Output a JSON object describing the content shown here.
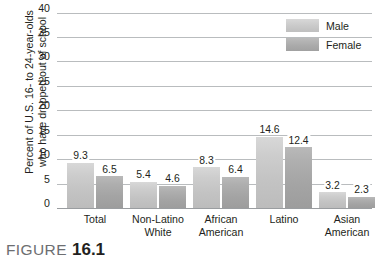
{
  "figure": {
    "caption_word": "FIGURE",
    "caption_number": "16.1"
  },
  "legend": {
    "position": "top-right",
    "items": [
      {
        "label": "Male",
        "color": "#c9c9c9",
        "swatch_name": "legend-swatch-male"
      },
      {
        "label": "Female",
        "color": "#ababab",
        "swatch_name": "legend-swatch-female"
      }
    ]
  },
  "axis": {
    "y_title_line1": "Percent of U.S. 16- to 24-year-olds",
    "y_title_line2": "who have dropped out of school",
    "y_ticks": [
      "0",
      "5",
      "10",
      "15",
      "20",
      "25",
      "30",
      "35",
      "40"
    ]
  },
  "chart_data": {
    "type": "bar",
    "title": "",
    "subtitle": "",
    "xlabel": "",
    "ylabel": "Percent of U.S. 16- to 24-year-olds who have dropped out of school",
    "ylim": [
      0,
      40
    ],
    "ytick_step": 5,
    "grid": true,
    "legend_position": "top-right",
    "categories": [
      "Total",
      "Non-Latino White",
      "African American",
      "Latino",
      "Asian American"
    ],
    "category_lines": [
      [
        "Total"
      ],
      [
        "Non-Latino",
        "White"
      ],
      [
        "African",
        "American"
      ],
      [
        "Latino"
      ],
      [
        "Asian",
        "American"
      ]
    ],
    "series": [
      {
        "name": "Male",
        "color": "#c9c9c9",
        "values": [
          9.3,
          5.4,
          8.3,
          14.6,
          3.2
        ]
      },
      {
        "name": "Female",
        "color": "#ababab",
        "values": [
          6.5,
          4.6,
          6.4,
          12.4,
          2.3
        ]
      }
    ],
    "value_labels": {
      "Male": [
        "9.3",
        "5.4",
        "8.3",
        "14.6",
        "3.2"
      ],
      "Female": [
        "6.5",
        "4.6",
        "6.4",
        "12.4",
        "2.3"
      ]
    }
  }
}
